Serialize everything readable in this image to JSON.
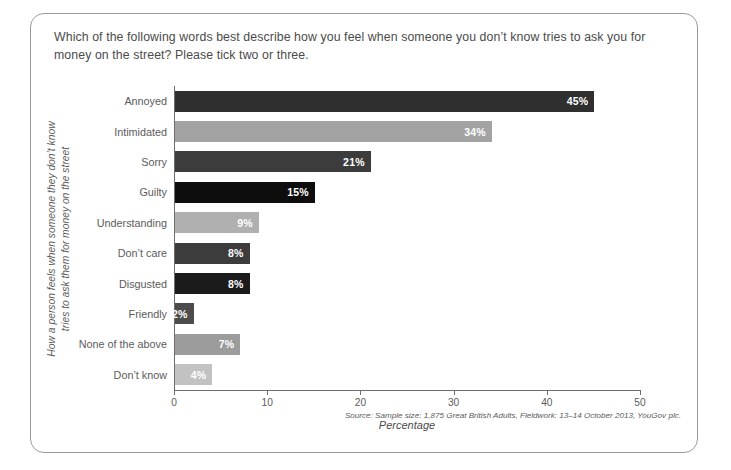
{
  "question": "Which of the following words best describe how you feel when someone you don’t know tries to ask you for money on the street? Please tick two or three.",
  "source": "Source: Sample size: 1,875 Great British Adults, Fieldwork: 13–14 October 2013, YouGov plc.",
  "chart_data": {
    "type": "bar",
    "orientation": "horizontal",
    "title": "",
    "xlabel": "Percentage",
    "ylabel": "How a person feels when someone they don’t know tries to ask them for money on the street",
    "ylabel_lines": [
      "How a person feels when someone they don’t know",
      "tries to ask them for money on the street"
    ],
    "categories": [
      "Annoyed",
      "Intimidated",
      "Sorry",
      "Guilty",
      "Understanding",
      "Don’t care",
      "Disgusted",
      "Friendly",
      "None of the above",
      "Don’t know"
    ],
    "values": [
      45,
      34,
      21,
      15,
      9,
      8,
      8,
      2,
      7,
      4
    ],
    "value_labels": [
      "45%",
      "34%",
      "21%",
      "15%",
      "9%",
      "8%",
      "8%",
      "2%",
      "7%",
      "4%"
    ],
    "colors": [
      "#2f2f2f",
      "#a3a3a3",
      "#3c3c3c",
      "#0d0d0d",
      "#b0b0b0",
      "#3c3c3c",
      "#1b1b1b",
      "#4c4c4c",
      "#9c9c9c",
      "#c2c2c2"
    ],
    "xlim": [
      0,
      50
    ],
    "xticks": [
      0,
      10,
      20,
      30,
      40,
      50
    ],
    "xtick_labels": [
      "0",
      "10",
      "20",
      "30",
      "40",
      "50"
    ],
    "grid": false,
    "legend": false
  }
}
